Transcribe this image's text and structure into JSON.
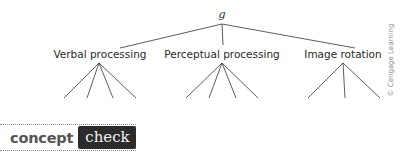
{
  "diagram": {
    "root": {
      "label": "g"
    },
    "factors": [
      {
        "label": "Verbal processing",
        "subtests": 4
      },
      {
        "label": "Perceptual processing",
        "subtests": 4
      },
      {
        "label": "Image rotation",
        "subtests": 3
      }
    ],
    "credit": "© Cengage Learning"
  },
  "concept_check": {
    "word1": "concept",
    "word2": "check"
  }
}
